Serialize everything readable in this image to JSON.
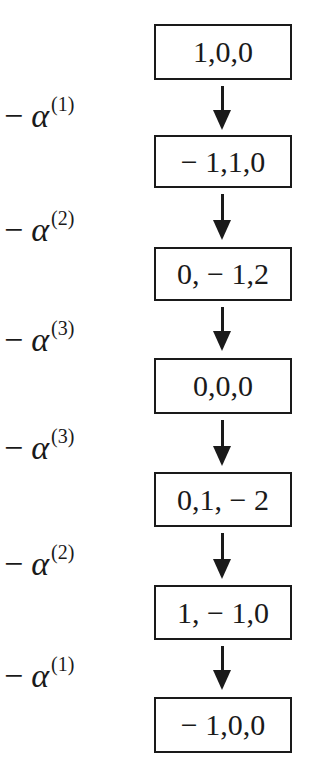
{
  "diagram": {
    "nodes": [
      {
        "label": "1,0,0"
      },
      {
        "label": "− 1,1,0"
      },
      {
        "label": "0, − 1,2"
      },
      {
        "label": "0,0,0"
      },
      {
        "label": "0,1, − 2"
      },
      {
        "label": "1, − 1,0"
      },
      {
        "label": "− 1,0,0"
      }
    ],
    "edges": [
      {
        "minus": "−",
        "symbol": "α",
        "index": "(1)"
      },
      {
        "minus": "−",
        "symbol": "α",
        "index": "(2)"
      },
      {
        "minus": "−",
        "symbol": "α",
        "index": "(3)"
      },
      {
        "minus": "−",
        "symbol": "α",
        "index": "(3)"
      },
      {
        "minus": "−",
        "symbol": "α",
        "index": "(2)"
      },
      {
        "minus": "−",
        "symbol": "α",
        "index": "(1)"
      }
    ]
  }
}
